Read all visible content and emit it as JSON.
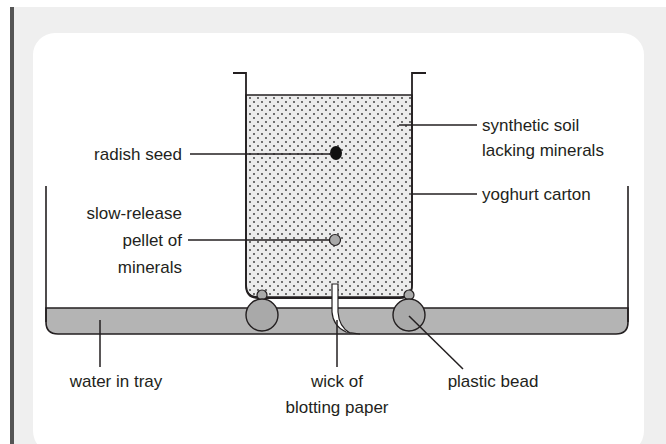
{
  "figure": {
    "colors": {
      "frame_bg": "#efefef",
      "left_bar": "#555555",
      "panel_bg": "#ffffff",
      "soil_fill": "#ececec",
      "water_fill": "#b4b4b4",
      "bead_fill": "#a9a9a9",
      "pellet_fill": "#a9a9a9",
      "seed_fill": "#111111",
      "line": "#231f20"
    }
  },
  "labels": {
    "radish_seed": "radish seed",
    "pellet_line1": "slow-release",
    "pellet_line2": "pellet of",
    "pellet_line3": "minerals",
    "soil_line1": "synthetic soil",
    "soil_line2": "lacking minerals",
    "carton": "yoghurt carton",
    "water": "water in tray",
    "wick_line1": "wick of",
    "wick_line2": "blotting paper",
    "bead": "plastic bead"
  }
}
